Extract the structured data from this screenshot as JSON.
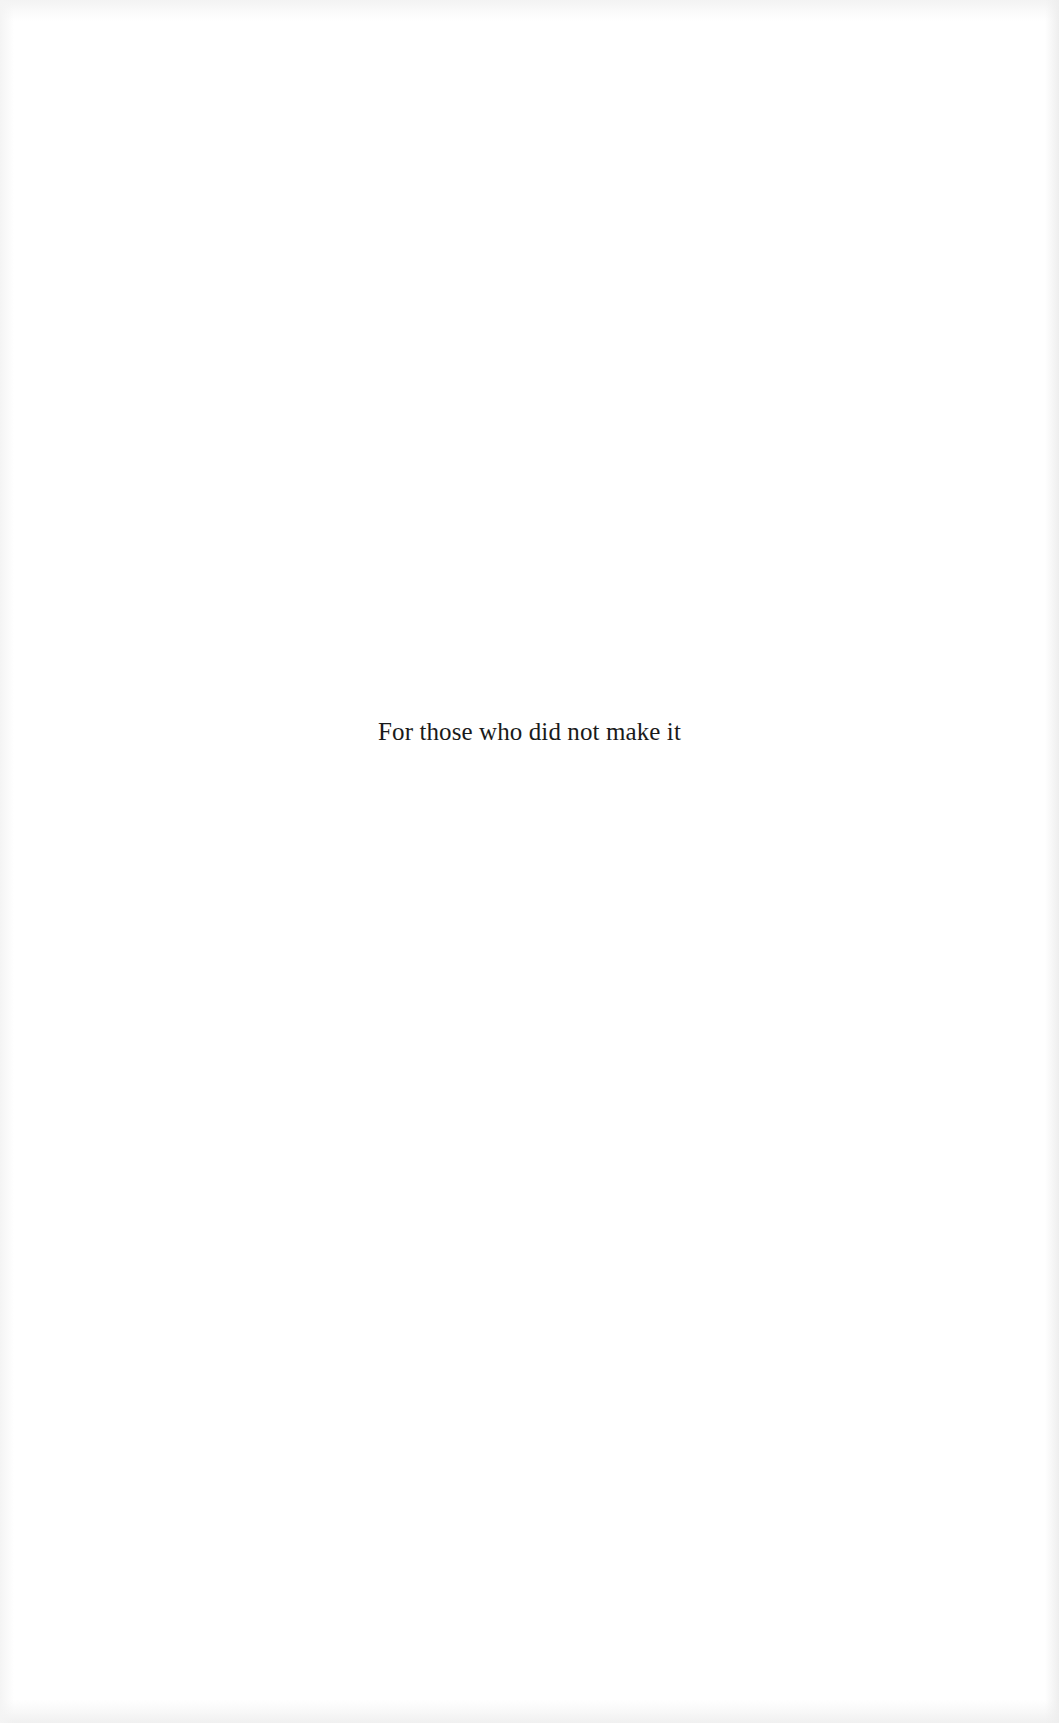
{
  "page": {
    "type": "dedication",
    "dedication_text": "For those who did not make it"
  },
  "colors": {
    "background": "#ffffff",
    "text": "#1a1a1a"
  }
}
